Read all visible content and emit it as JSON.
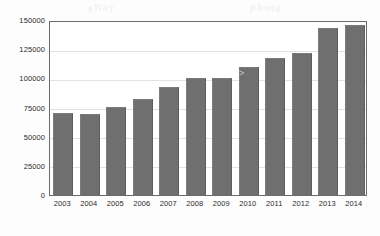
{
  "chart_data": {
    "type": "bar",
    "title": "",
    "subtitle": "",
    "xlabel": "",
    "ylabel": "",
    "categories": [
      "2003",
      "2004",
      "2005",
      "2006",
      "2007",
      "2008",
      "2009",
      "2010",
      "2011",
      "2012",
      "2013",
      "2014"
    ],
    "values": [
      70500,
      69500,
      75500,
      82500,
      93000,
      100500,
      100700,
      110000,
      117500,
      122000,
      143000,
      146000
    ],
    "series": [
      {
        "name": "",
        "values": [
          70500,
          69500,
          75500,
          82500,
          93000,
          100500,
          100700,
          110000,
          117500,
          122000,
          143000,
          146000
        ]
      }
    ],
    "ylim": [
      0,
      150000
    ],
    "ytick_values": [
      0,
      25000,
      50000,
      75000,
      100000,
      125000,
      150000
    ],
    "ytick_labels": [
      "0",
      "25000",
      "50000",
      "75000",
      "100000",
      "125000",
      "150000"
    ],
    "xtick_labels": [
      "2003",
      "2004",
      "2005",
      "2006",
      "2007",
      "2008",
      "2009",
      "2010",
      "2011",
      "2012",
      "2013",
      "2014"
    ],
    "grid": true,
    "grid_axis": "y",
    "legend": false,
    "legend_position": "none",
    "bar_color": "#6f6f6f",
    "plot_background": "#ffffff",
    "frame_color": "#6b6b6b",
    "gridline_color": "#e2e2e2",
    "annotations": []
  },
  "watermarks": {
    "left": "eBay",
    "right": "photo"
  },
  "artifacts": {
    "speck": ">"
  }
}
